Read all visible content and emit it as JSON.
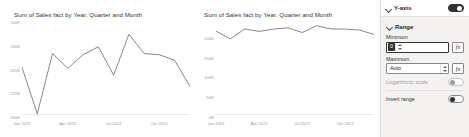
{
  "charts": [
    {
      "id": "chart-auto-min",
      "title": "Sum of Sales fact by Year, Quarter and Month",
      "chart_data": {
        "type": "line",
        "title": "Sum of Sales fact by Year, Quarter and Month",
        "xlabel": "",
        "ylabel": "",
        "grid": false,
        "legend": null,
        "ylim": [
          200000,
          240000
        ],
        "yticks": [
          "200K",
          "210K",
          "220K",
          "230K",
          "240K"
        ],
        "ytick_values": [
          200000,
          210000,
          220000,
          230000,
          240000
        ],
        "x": [
          "Jan 2021",
          "Feb 2021",
          "Mar 2021",
          "Apr 2021",
          "May 2021",
          "Jun 2021",
          "Jul 2021",
          "Aug 2021",
          "Sep 2021",
          "Oct 2021",
          "Nov 2021",
          "Dec 2021"
        ],
        "xticks": [
          "Jan 2021",
          "Apr 2021",
          "Jul 2021",
          "Oct 2021"
        ],
        "xtick_positions": [
          0,
          3,
          6,
          9
        ],
        "series": [
          {
            "name": "Sum of Sales fact",
            "values": [
              221000,
              200500,
              227000,
              220500,
              226500,
              230000,
              217500,
              235500,
              227000,
              226500,
              224000,
              212500
            ]
          }
        ]
      }
    },
    {
      "id": "chart-zero-min",
      "title": "Sum of Sales fact by Year, Quarter and Month",
      "chart_data": {
        "type": "line",
        "title": "Sum of Sales fact by Year, Quarter and Month",
        "xlabel": "",
        "ylabel": "",
        "grid": false,
        "legend": null,
        "ylim": [
          0,
          240000
        ],
        "yticks": [
          "0K",
          "50K",
          "100K",
          "150K",
          "200K"
        ],
        "ytick_values": [
          0,
          50000,
          100000,
          150000,
          200000
        ],
        "x": [
          "Jan 2021",
          "Feb 2021",
          "Mar 2021",
          "Apr 2021",
          "May 2021",
          "Jun 2021",
          "Jul 2021",
          "Aug 2021",
          "Sep 2021",
          "Oct 2021",
          "Nov 2021",
          "Dec 2021"
        ],
        "xticks": [
          "Jan 2021",
          "Apr 2021",
          "Jul 2021",
          "Oct 2021"
        ],
        "xtick_positions": [
          0,
          3,
          6,
          9
        ],
        "series": [
          {
            "name": "Sum of Sales fact",
            "values": [
              221000,
              200500,
              227000,
              220500,
              226500,
              230000,
              217500,
              235500,
              227000,
              226500,
              224000,
              212500
            ]
          }
        ]
      }
    }
  ],
  "panel": {
    "header": {
      "title": "Y-axis",
      "toggle_state": "on"
    },
    "sections": [
      {
        "title": "Range",
        "fields": [
          {
            "label": "Minimum",
            "value": "0",
            "focused": true,
            "fx_label": "fx"
          },
          {
            "label": "Maximum",
            "value": "Auto",
            "focused": false,
            "fx_label": "fx"
          }
        ],
        "options": [
          {
            "label": "Logarithmic scale",
            "toggle_state": "off",
            "disabled": true
          },
          {
            "label": "Invert range",
            "toggle_state": "off",
            "disabled": false
          }
        ]
      }
    ]
  },
  "colors": {
    "line": "#7b7b7b",
    "axis_text": "#9a9a9a",
    "title_text": "#333333",
    "panel_bg": "#f3f2f1",
    "accent": "#323130"
  }
}
